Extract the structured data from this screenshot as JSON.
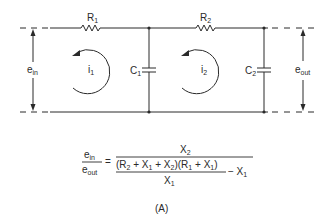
{
  "diagram": {
    "type": "two-stage RC ladder network",
    "components": {
      "R1": {
        "letter": "R",
        "sub": "1"
      },
      "R2": {
        "letter": "R",
        "sub": "2"
      },
      "C1": {
        "letter": "C",
        "sub": "1"
      },
      "C2": {
        "letter": "C",
        "sub": "2"
      }
    },
    "loops": {
      "i1": {
        "letter": "i",
        "sub": "1"
      },
      "i2": {
        "letter": "i",
        "sub": "2"
      }
    },
    "terminals": {
      "input": {
        "letter": "e",
        "sub": "in"
      },
      "output": {
        "letter": "e",
        "sub": "out"
      }
    }
  },
  "equation": {
    "lhs_num": {
      "letter": "e",
      "sub": "in"
    },
    "lhs_den": {
      "letter": "e",
      "sub": "out"
    },
    "equals": "=",
    "rhs_num": {
      "letter": "X",
      "sub": "2"
    },
    "inner_num": {
      "p1": "(R",
      "p1sub": "2",
      "p2": " + X",
      "p2sub": "1",
      "p3": " + X",
      "p3sub": "2",
      "p4": ")(R",
      "p4sub": "1",
      "p5": " + X",
      "p5sub": "1",
      "p6": ")"
    },
    "inner_den": {
      "letter": "X",
      "sub": "1"
    },
    "minus_term": {
      "text": "− X",
      "sub": "1"
    }
  },
  "caption": "(A)",
  "colors": {
    "ink": "#2a2a2a",
    "background": "#ffffff"
  }
}
